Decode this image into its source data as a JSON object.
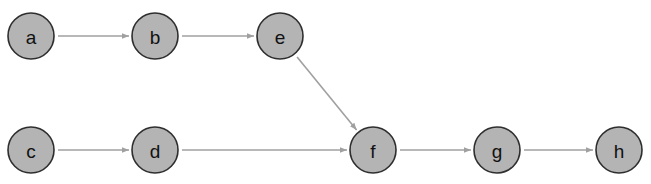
{
  "diagram": {
    "type": "directed-graph",
    "node_radius": 23,
    "colors": {
      "node_fill": "#b4b4b4",
      "node_stroke": "#2e2e2e",
      "edge": "#a0a0a0",
      "label": "#111111",
      "background": "#ffffff"
    },
    "nodes": [
      {
        "id": "a",
        "label": "a",
        "x": 31,
        "y": 36
      },
      {
        "id": "b",
        "label": "b",
        "x": 155,
        "y": 36
      },
      {
        "id": "e",
        "label": "e",
        "x": 280,
        "y": 36
      },
      {
        "id": "c",
        "label": "c",
        "x": 31,
        "y": 150
      },
      {
        "id": "d",
        "label": "d",
        "x": 155,
        "y": 150
      },
      {
        "id": "f",
        "label": "f",
        "x": 373,
        "y": 150
      },
      {
        "id": "g",
        "label": "g",
        "x": 497,
        "y": 150
      },
      {
        "id": "h",
        "label": "h",
        "x": 619,
        "y": 150
      }
    ],
    "edges": [
      {
        "from": "a",
        "to": "b"
      },
      {
        "from": "b",
        "to": "e"
      },
      {
        "from": "e",
        "to": "f"
      },
      {
        "from": "c",
        "to": "d"
      },
      {
        "from": "d",
        "to": "f"
      },
      {
        "from": "f",
        "to": "g"
      },
      {
        "from": "g",
        "to": "h"
      }
    ]
  }
}
